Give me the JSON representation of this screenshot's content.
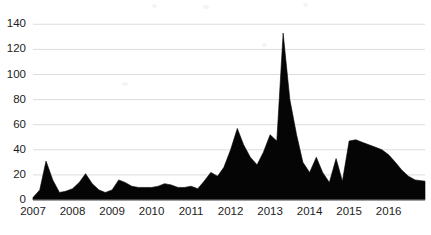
{
  "chart_data": {
    "type": "area",
    "title": "",
    "subtitle": "",
    "xlabel": "",
    "ylabel": "",
    "xlim": [
      2007.0,
      2016.92
    ],
    "ylim": [
      0,
      145
    ],
    "grid": true,
    "grid_axis": "y",
    "legend": false,
    "legend_position": "none",
    "series_name": "Value",
    "series_color": "#050505",
    "grid_color": "#d9d9d9",
    "axis_color": "#8a8a8a",
    "text_color": "#1d1d1d",
    "background_color": "#ffffff",
    "ytick_values": [
      0,
      20,
      40,
      60,
      80,
      100,
      120,
      140
    ],
    "ytick_labels": [
      "0",
      "20",
      "40",
      "60",
      "80",
      "100",
      "120",
      "140"
    ],
    "xtick_values": [
      2007,
      2008,
      2009,
      2010,
      2011,
      2012,
      2013,
      2014,
      2015,
      2016
    ],
    "xtick_labels": [
      "2007",
      "2008",
      "2009",
      "2010",
      "2011",
      "2012",
      "2013",
      "2014",
      "2015",
      "2016"
    ],
    "x": [
      2007.0,
      2007.17,
      2007.33,
      2007.5,
      2007.67,
      2007.83,
      2008.0,
      2008.17,
      2008.33,
      2008.5,
      2008.67,
      2008.83,
      2009.0,
      2009.17,
      2009.33,
      2009.5,
      2009.67,
      2009.83,
      2010.0,
      2010.17,
      2010.33,
      2010.5,
      2010.67,
      2010.83,
      2011.0,
      2011.17,
      2011.33,
      2011.5,
      2011.67,
      2011.83,
      2012.0,
      2012.17,
      2012.33,
      2012.5,
      2012.67,
      2012.83,
      2013.0,
      2013.17,
      2013.33,
      2013.5,
      2013.67,
      2013.83,
      2014.0,
      2014.17,
      2014.33,
      2014.5,
      2014.67,
      2014.83,
      2015.0,
      2015.17,
      2015.33,
      2015.5,
      2015.67,
      2015.83,
      2016.0,
      2016.17,
      2016.33,
      2016.5,
      2016.67,
      2016.92
    ],
    "values": [
      2,
      8,
      31,
      16,
      6,
      7,
      9,
      14,
      21,
      13,
      8,
      6,
      8,
      16,
      14,
      11,
      10,
      10,
      10,
      11,
      13,
      12,
      10,
      10,
      11,
      9,
      15,
      22,
      19,
      26,
      40,
      57,
      44,
      34,
      28,
      38,
      52,
      47,
      133,
      80,
      52,
      30,
      22,
      34,
      22,
      14,
      33,
      15,
      47,
      48,
      46,
      44,
      42,
      40,
      36,
      30,
      24,
      19,
      16,
      15
    ],
    "annotations": []
  }
}
